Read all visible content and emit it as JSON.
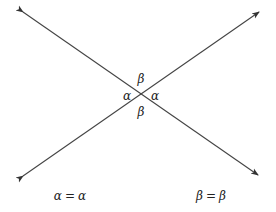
{
  "diagram": {
    "title": "",
    "line_color": "#444444",
    "text_color": "#222222",
    "intersection": {
      "x": 141,
      "y": 96
    },
    "lines": [
      {
        "name": "line-nw-se",
        "from": {
          "x": 23,
          "y": 12
        },
        "to": {
          "x": 258,
          "y": 175
        },
        "arrows": "both"
      },
      {
        "name": "line-sw-ne",
        "from": {
          "x": 23,
          "y": 176
        },
        "to": {
          "x": 259,
          "y": 12
        },
        "arrows": "both"
      }
    ],
    "angle_labels": {
      "top": "β",
      "left": "α",
      "right": "α",
      "bottom": "β"
    },
    "equations": {
      "alpha": {
        "lhs": "α",
        "op": "=",
        "rhs": "α"
      },
      "beta": {
        "lhs": "β",
        "op": "=",
        "rhs": "β"
      }
    }
  }
}
